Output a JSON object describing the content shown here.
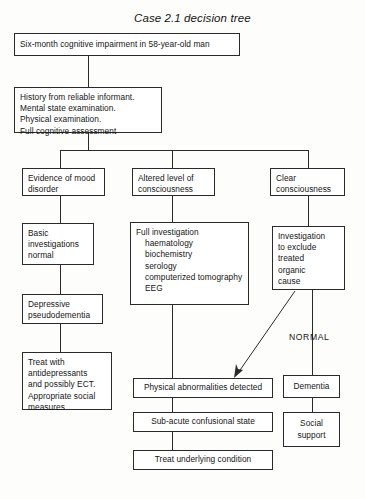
{
  "figure": {
    "title": "Case 2.1 decision tree",
    "ink_color": "#2a2a2a",
    "background_color": "#fdfdfc"
  },
  "nodes": {
    "presentation": {
      "text": "Six-month cognitive impairment in 58-year-old man"
    },
    "assessment": {
      "line1": "History from reliable informant.",
      "line2": "Mental state examination.",
      "line3": "Physical examination.",
      "line4": "Full cognitive assessment"
    },
    "branch_mood": {
      "line1": "Evidence of mood",
      "line2": "disorder"
    },
    "branch_altered": {
      "line1": "Altered level of",
      "line2": "consciousness"
    },
    "branch_clear": {
      "line1": "Clear",
      "line2": "consciousness"
    },
    "basic_investigations": {
      "line1": "Basic",
      "line2": "investigations",
      "line3": "normal"
    },
    "full_investigation": {
      "line1": "Full investigation",
      "line2": "haematology",
      "line3": "biochemistry",
      "line4": "serology",
      "line5": "computerized tomography",
      "line6": "EEG"
    },
    "investigation_exclude": {
      "line1": "Investigation",
      "line2": "to exclude",
      "line3": "treated",
      "line4": "organic",
      "line5": "cause"
    },
    "depressive_pseudodementia": {
      "line1": "Depressive",
      "line2": "pseudodementia"
    },
    "treat_depression": {
      "line1": "Treat with",
      "line2": "antidepressants",
      "line3": "and possibly ECT.",
      "line4": "Appropriate social",
      "line5": "measures"
    },
    "physical_abnormalities": {
      "text": "Physical abnormalities detected"
    },
    "subacute_confusional": {
      "text": "Sub-acute confusional state"
    },
    "treat_underlying": {
      "text": "Treat underlying condition"
    },
    "dementia": {
      "text": "Dementia"
    },
    "social_support": {
      "line1": "Social",
      "line2": "support"
    }
  },
  "annotations": {
    "normal_branch_label": "NORMAL"
  }
}
